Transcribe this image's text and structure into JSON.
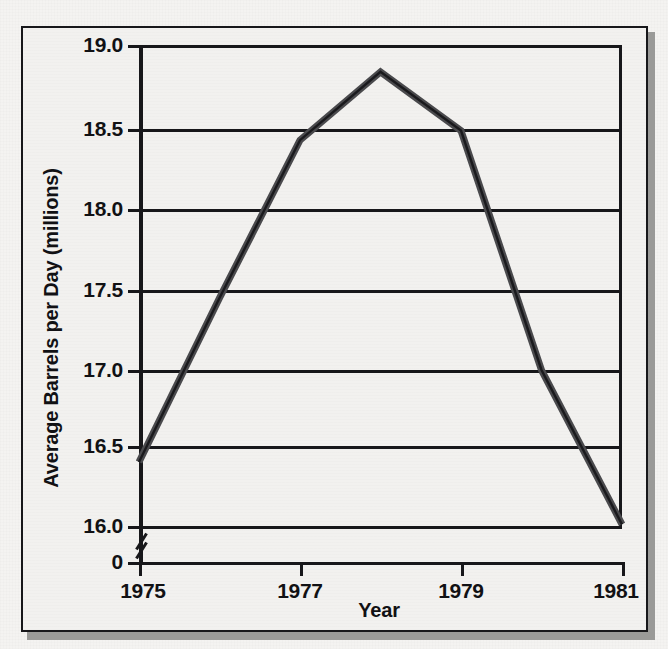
{
  "chart_data": {
    "type": "line",
    "title": "",
    "xlabel": "Year",
    "ylabel": "Average Barrels per Day (millions)",
    "x": [
      1975,
      1976,
      1977,
      1978,
      1979,
      1980,
      1981
    ],
    "values": [
      16.4,
      17.45,
      18.43,
      18.84,
      18.49,
      17.0,
      16.01
    ],
    "series": [
      {
        "name": "Average Barrels per Day (millions)",
        "values": [
          16.4,
          17.45,
          18.43,
          18.84,
          18.49,
          17.0,
          16.01
        ]
      }
    ],
    "xlim": [
      1975,
      1981
    ],
    "ylim": [
      16.0,
      19.0
    ],
    "x_tick_labels": [
      "1975",
      "1977",
      "1979",
      "1981"
    ],
    "x_tick_values": [
      1975,
      1977,
      1979,
      1981
    ],
    "y_tick_labels": [
      "19.0",
      "18.5",
      "18.0",
      "17.5",
      "17.0",
      "16.5",
      "16.0",
      "0"
    ],
    "y_tick_values": [
      19.0,
      18.5,
      18.0,
      17.5,
      17.0,
      16.5,
      16.0,
      0
    ],
    "grid": true,
    "grid_axis": "y",
    "legend": false,
    "legend_position": "none",
    "axis_break": true,
    "axis_break_between": [
      16.0,
      0
    ],
    "line_color": "#4a4a4d",
    "axis_color": "#17171a",
    "background_color": "#f2f1ef"
  },
  "axis": {
    "y_title": "Average Barrels per Day (millions)",
    "x_title": "Year",
    "y_ticks": [
      {
        "label": "19.0",
        "value": 19.0
      },
      {
        "label": "18.5",
        "value": 18.5
      },
      {
        "label": "18.0",
        "value": 18.0
      },
      {
        "label": "17.5",
        "value": 17.5
      },
      {
        "label": "17.0",
        "value": 17.0
      },
      {
        "label": "16.5",
        "value": 16.5
      },
      {
        "label": "16.0",
        "value": 16.0
      },
      {
        "label": "0",
        "value": 0
      }
    ],
    "x_ticks": [
      {
        "label": "1975",
        "value": 1975
      },
      {
        "label": "1977",
        "value": 1977
      },
      {
        "label": "1979",
        "value": 1979
      },
      {
        "label": "1981",
        "value": 1981
      }
    ]
  }
}
